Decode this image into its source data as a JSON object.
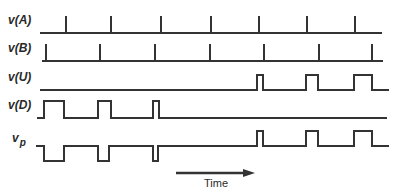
{
  "diagram": {
    "type": "timing-diagram",
    "color": "#333333",
    "signals": [
      {
        "id": "vA",
        "label": "v(A)",
        "label_pos": [
          8,
          24
        ],
        "kind": "impulse",
        "baseline_y": 33,
        "x_start": 40,
        "x_end": 382,
        "spike_top_y": 16,
        "spikes_x": [
          66,
          111,
          161,
          211,
          259,
          307,
          355
        ]
      },
      {
        "id": "vB",
        "label": "v(B)",
        "label_pos": [
          8,
          52
        ],
        "kind": "impulse",
        "baseline_y": 61,
        "x_start": 42,
        "x_end": 383,
        "spike_top_y": 44,
        "spikes_x": [
          46,
          100,
          155,
          210,
          264,
          319,
          372
        ]
      },
      {
        "id": "vU",
        "label": "v(U)",
        "label_pos": [
          8,
          81
        ],
        "kind": "pulse",
        "low_y": 90,
        "high_y": 75,
        "x_start": 40,
        "x_end": 389,
        "pulses": [
          [
            257,
            263
          ],
          [
            306,
            318
          ],
          [
            354,
            372
          ]
        ]
      },
      {
        "id": "vD",
        "label": "v(D)",
        "label_pos": [
          8,
          109
        ],
        "kind": "pulse",
        "low_y": 118,
        "high_y": 101,
        "x_start": 37,
        "x_end": 387,
        "pulses": [
          [
            44,
            64
          ],
          [
            98,
            111
          ],
          [
            153,
            159
          ]
        ]
      },
      {
        "id": "vp",
        "label": "v",
        "subscript": "p",
        "label_pos": [
          12,
          142
        ],
        "kind": "bipolar",
        "mid_y": 146,
        "low_y": 161,
        "high_y": 131,
        "x_start": 36,
        "x_end": 389,
        "down_pulses": [
          [
            44,
            64
          ],
          [
            98,
            109
          ],
          [
            153,
            158
          ]
        ],
        "up_pulses": [
          [
            257,
            263
          ],
          [
            306,
            318
          ],
          [
            354,
            372
          ]
        ]
      }
    ],
    "time_axis": {
      "label": "Time",
      "arrow_x1": 176,
      "arrow_x2": 255,
      "arrow_y": 173,
      "label_x": 204,
      "label_y": 187
    }
  }
}
